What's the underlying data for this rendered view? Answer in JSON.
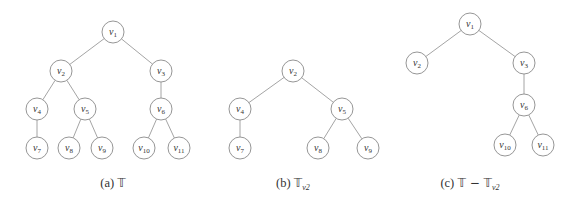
{
  "panels": [
    {
      "id": "a",
      "caption": {
        "prefix": "(a)",
        "symbol": "𝕋",
        "suffix": "",
        "sub": ""
      },
      "caption_x": 113,
      "nodes": [
        {
          "id": "v1",
          "base": "v",
          "sub": "1",
          "x": 113,
          "y": 32
        },
        {
          "id": "v2",
          "base": "v",
          "sub": "2",
          "x": 61,
          "y": 71
        },
        {
          "id": "v3",
          "base": "v",
          "sub": "3",
          "x": 161,
          "y": 71
        },
        {
          "id": "v4",
          "base": "v",
          "sub": "4",
          "x": 37,
          "y": 109
        },
        {
          "id": "v5",
          "base": "v",
          "sub": "5",
          "x": 85,
          "y": 109
        },
        {
          "id": "v6",
          "base": "v",
          "sub": "6",
          "x": 161,
          "y": 109
        },
        {
          "id": "v7",
          "base": "v",
          "sub": "7",
          "x": 37,
          "y": 148
        },
        {
          "id": "v8",
          "base": "v",
          "sub": "8",
          "x": 69,
          "y": 148
        },
        {
          "id": "v9",
          "base": "v",
          "sub": "9",
          "x": 102,
          "y": 148
        },
        {
          "id": "v10",
          "base": "v",
          "sub": "10",
          "x": 144,
          "y": 148
        },
        {
          "id": "v11",
          "base": "v",
          "sub": "11",
          "x": 179,
          "y": 148
        }
      ],
      "edges": [
        [
          "v1",
          "v2"
        ],
        [
          "v1",
          "v3"
        ],
        [
          "v2",
          "v4"
        ],
        [
          "v2",
          "v5"
        ],
        [
          "v3",
          "v6"
        ],
        [
          "v4",
          "v7"
        ],
        [
          "v5",
          "v8"
        ],
        [
          "v5",
          "v9"
        ],
        [
          "v6",
          "v10"
        ],
        [
          "v6",
          "v11"
        ]
      ]
    },
    {
      "id": "b",
      "caption": {
        "prefix": "(b)",
        "symbol": "𝕋",
        "suffix": "",
        "sub": "v2"
      },
      "caption_x": 293,
      "nodes": [
        {
          "id": "v2",
          "base": "v",
          "sub": "2",
          "x": 293,
          "y": 71
        },
        {
          "id": "v4",
          "base": "v",
          "sub": "4",
          "x": 240,
          "y": 109
        },
        {
          "id": "v5",
          "base": "v",
          "sub": "5",
          "x": 342,
          "y": 109
        },
        {
          "id": "v7",
          "base": "v",
          "sub": "7",
          "x": 240,
          "y": 148
        },
        {
          "id": "v8",
          "base": "v",
          "sub": "8",
          "x": 318,
          "y": 148
        },
        {
          "id": "v9",
          "base": "v",
          "sub": "9",
          "x": 368,
          "y": 148
        }
      ],
      "edges": [
        [
          "v2",
          "v4"
        ],
        [
          "v2",
          "v5"
        ],
        [
          "v4",
          "v7"
        ],
        [
          "v5",
          "v8"
        ],
        [
          "v5",
          "v9"
        ]
      ]
    },
    {
      "id": "c",
      "caption": {
        "prefix": "(c)",
        "symbol": "𝕋 − 𝕋",
        "suffix": "",
        "sub": "v2"
      },
      "caption_x": 470,
      "nodes": [
        {
          "id": "v1",
          "base": "v",
          "sub": "1",
          "x": 470,
          "y": 24
        },
        {
          "id": "v2",
          "base": "v",
          "sub": "2",
          "x": 417,
          "y": 63
        },
        {
          "id": "v3",
          "base": "v",
          "sub": "3",
          "x": 524,
          "y": 63
        },
        {
          "id": "v6",
          "base": "v",
          "sub": "6",
          "x": 524,
          "y": 105
        },
        {
          "id": "v10",
          "base": "v",
          "sub": "10",
          "x": 505,
          "y": 145
        },
        {
          "id": "v11",
          "base": "v",
          "sub": "11",
          "x": 543,
          "y": 145
        }
      ],
      "edges": [
        [
          "v1",
          "v2"
        ],
        [
          "v1",
          "v3"
        ],
        [
          "v3",
          "v6"
        ],
        [
          "v6",
          "v10"
        ],
        [
          "v6",
          "v11"
        ]
      ]
    }
  ],
  "style": {
    "node_radius": 11,
    "edge_color": "#9a9a9a",
    "node_stroke": "#8a8a8a",
    "text_color": "#333333",
    "caption_y": 187
  }
}
